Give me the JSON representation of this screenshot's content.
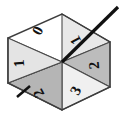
{
  "figure": {
    "name": "hexagonal-spinner-wheel",
    "background_color": "#ffffff",
    "outline_color": "#4a4a4a",
    "pointer_color": "#111111",
    "center": {
      "x": 62,
      "y": 62
    }
  },
  "chart_data": {
    "type": "pie",
    "title": "",
    "xlabel": "",
    "ylabel": "",
    "legend": "none",
    "grid": false,
    "shape": "hexagon",
    "sector_count": 6,
    "categories": [
      "0",
      "1",
      "2",
      "3",
      "2",
      "1"
    ],
    "values": [
      1,
      1,
      1,
      1,
      1,
      1
    ],
    "sectors": [
      {
        "index": 0,
        "label": "0",
        "position": "top-left",
        "fill": "#b9b9b9",
        "label_x": 42,
        "label_y": 33,
        "label_rotation": -62
      },
      {
        "index": 1,
        "label": "1",
        "position": "top-right",
        "fill": "#e8e8e8",
        "label_x": 80,
        "label_y": 38,
        "label_rotation": -118
      },
      {
        "index": 2,
        "label": "2",
        "position": "right",
        "fill": "#bcbcbc",
        "label_x": 99,
        "label_y": 65,
        "label_rotation": -95
      },
      {
        "index": 3,
        "label": "3",
        "position": "bottom-right",
        "fill": "#f0f0f0",
        "label_x": 80,
        "label_y": 93,
        "label_rotation": -62
      },
      {
        "index": 4,
        "label": "2",
        "position": "bottom-left",
        "fill": "#b5b5b5",
        "label_x": 43,
        "label_y": 91,
        "label_rotation": -118
      },
      {
        "index": 5,
        "label": "1",
        "position": "left",
        "fill": "#e4e4e4",
        "label_x": 24,
        "label_y": 63,
        "label_rotation": -95
      }
    ]
  },
  "pointer": {
    "name": "spinner-needle",
    "from_x": 62,
    "from_y": 62,
    "to_x": 118,
    "to_y": 7,
    "width": 3.2,
    "points_to_sector": "1"
  },
  "tick_mark": {
    "name": "edge-tick",
    "from_x": 17,
    "from_y": 97,
    "to_x": 30,
    "to_y": 86,
    "width": 2.6
  },
  "hexagon": {
    "vertices": [
      {
        "x": 62,
        "y": 14
      },
      {
        "x": 110,
        "y": 42
      },
      {
        "x": 110,
        "y": 87
      },
      {
        "x": 62,
        "y": 110
      },
      {
        "x": 8,
        "y": 83
      },
      {
        "x": 8,
        "y": 38
      }
    ]
  }
}
